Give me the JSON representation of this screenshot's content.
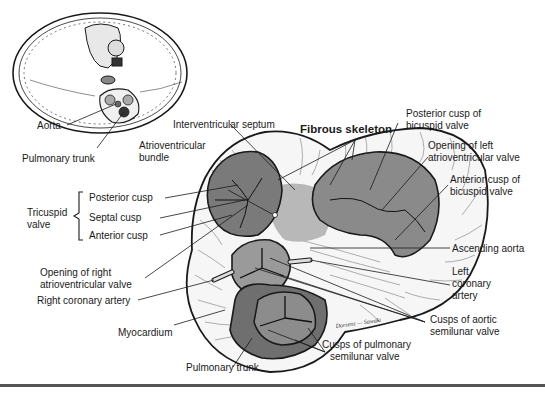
{
  "figure": {
    "inset": {
      "description": "Transverse section of thorax showing heart position",
      "labels": {
        "aorta": "Aorta",
        "pulmonary_trunk": "Pulmonary trunk"
      }
    },
    "labels": {
      "interventricular_septum": "Interventricular septum",
      "fibrous_skeleton": "Fibrous skeleton",
      "posterior_cusp_bicuspid_1": "Posterior cusp of",
      "posterior_cusp_bicuspid_2": "bicuspid valve",
      "atrioventricular_bundle_1": "Atrioventricular",
      "atrioventricular_bundle_2": "bundle",
      "opening_left_av_1": "Opening of left",
      "opening_left_av_2": "atrioventricular valve",
      "anterior_cusp_bicuspid_1": "Anterior cusp of",
      "anterior_cusp_bicuspid_2": "bicuspid valve",
      "tricuspid_valve_1": "Tricuspid",
      "tricuspid_valve_2": "valve",
      "posterior_cusp": "Posterior cusp",
      "septal_cusp": "Septal cusp",
      "anterior_cusp": "Anterior cusp",
      "ascending_aorta": "Ascending aorta",
      "opening_right_av_1": "Opening of right",
      "opening_right_av_2": "atrioventricular valve",
      "left_coronary_artery_1": "Left",
      "left_coronary_artery_2": "coronary",
      "left_coronary_artery_3": "artery",
      "right_coronary_artery": "Right coronary artery",
      "cusps_aortic_1": "Cusps of aortic",
      "cusps_aortic_2": "semilunar valve",
      "myocardium": "Myocardium",
      "cusps_pulmonary_1": "Cusps of pulmonary",
      "cusps_pulmonary_2": "semilunar valve",
      "pulmonary_trunk": "Pulmonary trunk",
      "signature": "Dorsenz — Sawaki"
    },
    "colors": {
      "ink": "#1a1a1a",
      "valve_fill": "#7a7a7a",
      "valve_fill_light": "#9a9a9a",
      "skeleton_fill": "#b8b8b8",
      "myocardium_fill": "#f4f4f4",
      "rule": "#555555"
    }
  }
}
